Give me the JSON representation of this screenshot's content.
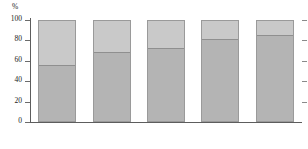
{
  "chart_data": {
    "type": "bar",
    "stacked": true,
    "title": "",
    "subtitle": "",
    "xlabel": "",
    "ylabel": "%",
    "unit_label": "%",
    "categories": [
      "2018",
      "2019",
      "2020",
      "2021",
      "2022"
    ],
    "ylim": [
      0,
      100
    ],
    "ytick_labels": [
      "100",
      "80",
      "60",
      "40",
      "20",
      "0"
    ],
    "ytick_values": [
      100,
      80,
      60,
      40,
      20,
      0
    ],
    "grid": false,
    "legend": false,
    "legend_position": "none",
    "series": [
      {
        "name": "lower-segment",
        "color": "#b4b4b4",
        "values": [
          55,
          68,
          72,
          80,
          84
        ]
      },
      {
        "name": "upper-segment",
        "color": "#c9c9c9",
        "values": [
          45,
          32,
          28,
          20,
          16
        ]
      }
    ],
    "totals": [
      100,
      100,
      100,
      100,
      100
    ],
    "annotations": []
  },
  "colors": {
    "axis": "#5d5d5d",
    "tick": "#6b6b6b",
    "bar_border": "#9a9a9a",
    "segment_divider": "#8f8f8f",
    "background": "#ffffff",
    "text": "#222222"
  }
}
